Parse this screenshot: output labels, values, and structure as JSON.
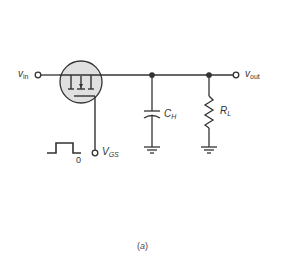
{
  "diagram": {
    "type": "circuit",
    "labels": {
      "vin_main": "v",
      "vin_sub": "in",
      "vout_main": "v",
      "vout_sub": "out",
      "vgs_main": "V",
      "vgs_sub": "GS",
      "ch_main": "C",
      "ch_sub": "H",
      "rl_main": "R",
      "rl_sub": "L",
      "pulse_zero": "0",
      "caption_letter": "a"
    },
    "components": [
      {
        "id": "mosfet",
        "kind": "MOSFET switch",
        "fill": "#e0e0e0"
      },
      {
        "id": "ch",
        "kind": "capacitor",
        "label": "C_H"
      },
      {
        "id": "rl",
        "kind": "resistor",
        "label": "R_L"
      },
      {
        "id": "gnd1",
        "kind": "ground"
      },
      {
        "id": "gnd2",
        "kind": "ground"
      },
      {
        "id": "pulse",
        "kind": "gate pulse waveform"
      }
    ],
    "colors": {
      "wire": "#333333",
      "mosfet_fill": "#e0e0e0",
      "text": "#333333"
    }
  }
}
